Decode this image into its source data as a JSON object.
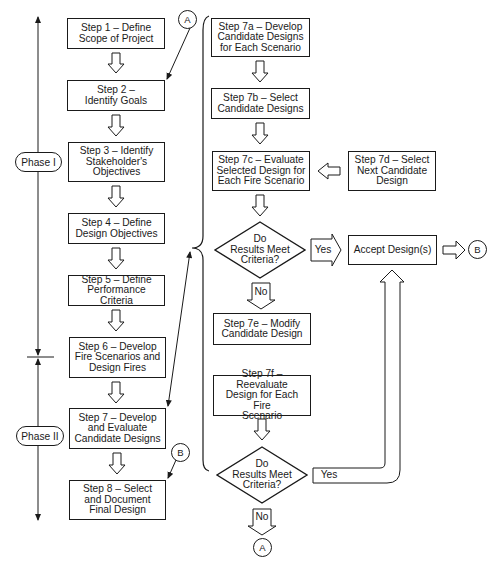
{
  "phases": {
    "phase1": "Phase I",
    "phase2": "Phase II"
  },
  "steps": {
    "s1": "Step 1 – Define\nScope of Project",
    "s2": "Step 2 –\nIdentify Goals",
    "s3": "Step 3 – Identify\nStakeholder's\nObjectives",
    "s4": "Step 4 – Define\nDesign Objectives",
    "s5": "Step 5 – Define\nPerformance Criteria",
    "s6": "Step 6 – Develop\nFire Scenarios and\nDesign Fires",
    "s7": "Step 7 – Develop\nand Evaluate\nCandidate Designs",
    "s8": "Step 8 – Select\nand Document\nFinal Design",
    "s7a": "Step 7a – Develop\nCandidate Designs\nfor Each Scenario",
    "s7b": "Step 7b – Select\nCandidate Designs",
    "s7c": "Step 7c – Evaluate\nSelected Design for\nEach Fire Scenario",
    "s7d": "Step 7d – Select\nNext Candidate\nDesign",
    "s7e": "Step 7e – Modify\nCandidate Design",
    "s7f": "Step 7f – Reevaluate\nDesign for Each Fire\nScenario",
    "accept": "Accept Design(s)"
  },
  "decisions": {
    "d1": "Do\nResults Meet\nCriteria?",
    "d2": "Do\nResults Meet\nCriteria?"
  },
  "branches": {
    "yes1": "Yes",
    "no1": "No",
    "yes2": "Yes",
    "no2": "No"
  },
  "connectors": {
    "a_top": "A",
    "a_bottom": "A",
    "b_left": "B",
    "b_right": "B"
  },
  "colors": {
    "stroke": "#1a1a1a",
    "background": "#ffffff"
  }
}
